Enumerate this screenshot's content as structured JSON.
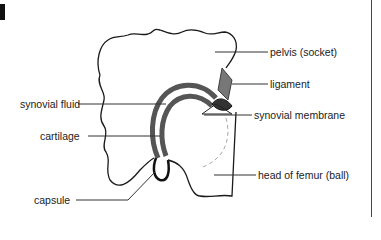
{
  "figure": {
    "colors": {
      "outline": "#1a1a1a",
      "cartilage": "#555555",
      "leader": "#333333",
      "dashed": "#aaaaaa",
      "background": "#ffffff"
    }
  },
  "labels": {
    "pelvis": "pelvis (socket)",
    "ligament": "ligament",
    "synovial_fluid": "synovial fluid",
    "synovial_membrane": "synovial membrane",
    "cartilage": "cartilage",
    "capsule": "capsule",
    "head_of_femur": "head of femur (ball)"
  }
}
